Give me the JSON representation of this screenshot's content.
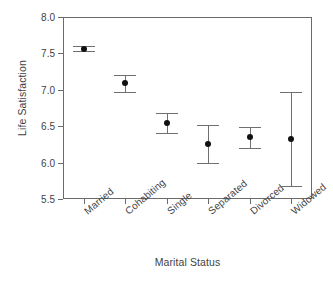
{
  "chart_data": {
    "type": "scatter",
    "title": "",
    "xlabel": "Marital Status",
    "ylabel": "Life Satisfaction",
    "categories": [
      "Married",
      "Cohabiting",
      "Single",
      "Separated",
      "Divorced",
      "Widowed"
    ],
    "values": [
      7.56,
      7.1,
      6.54,
      6.25,
      6.35,
      6.32
    ],
    "error_low": [
      7.53,
      6.97,
      6.41,
      5.99,
      6.2,
      5.68
    ],
    "error_high": [
      7.6,
      7.21,
      6.68,
      6.51,
      6.49,
      6.97
    ],
    "ylim": [
      5.5,
      8.0
    ],
    "yticks": [
      "5.5",
      "6.0",
      "6.5",
      "7.0",
      "7.5",
      "8.0"
    ],
    "ytick_values": [
      5.5,
      6.0,
      6.5,
      7.0,
      7.5,
      8.0
    ],
    "grid": false,
    "legend": "none",
    "marker": "filled-circle",
    "errorbar_style": "capped-vertical",
    "series": [
      {
        "name": "Mean life satisfaction",
        "points": [
          {
            "category": "Married",
            "value": 7.56,
            "ci_low": 7.53,
            "ci_high": 7.6
          },
          {
            "category": "Cohabiting",
            "value": 7.1,
            "ci_low": 6.97,
            "ci_high": 7.21
          },
          {
            "category": "Single",
            "value": 6.54,
            "ci_low": 6.41,
            "ci_high": 6.68
          },
          {
            "category": "Separated",
            "value": 6.25,
            "ci_low": 5.99,
            "ci_high": 6.51
          },
          {
            "category": "Divorced",
            "value": 6.35,
            "ci_low": 6.2,
            "ci_high": 6.49
          },
          {
            "category": "Widowed",
            "value": 6.32,
            "ci_low": 5.68,
            "ci_high": 6.97
          }
        ]
      }
    ]
  },
  "colors": {
    "marker": "#111111",
    "errorbar": "#6f6f6f",
    "axis": "#6b6b6b",
    "text": "#3f3f3f",
    "background": "#ffffff"
  }
}
